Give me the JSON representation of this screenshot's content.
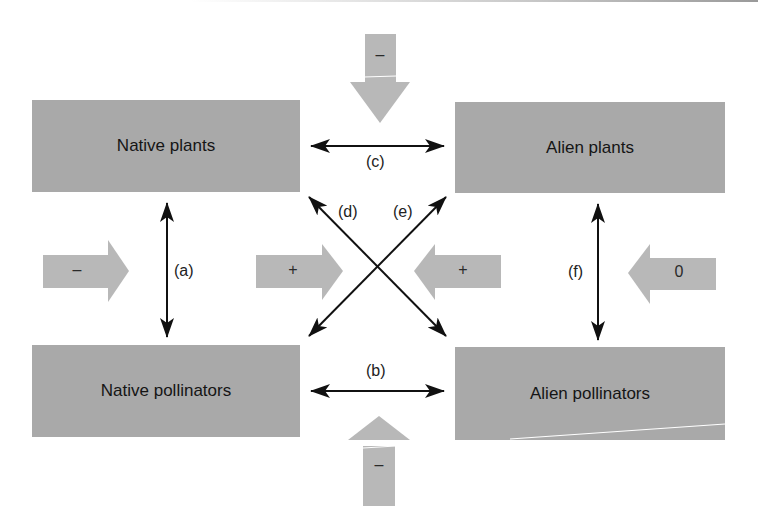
{
  "boxes": {
    "native_plants": "Native plants",
    "alien_plants": "Alien plants",
    "native_pollinators": "Native pollinators",
    "alien_pollinators": "Alien pollinators"
  },
  "interactions": {
    "a": "(a)",
    "b": "(b)",
    "c": "(c)",
    "d": "(d)",
    "e": "(e)",
    "f": "(f)"
  },
  "effects": {
    "top": "–",
    "bottom": "–",
    "left": "–",
    "center_left": "+",
    "center_right": "+",
    "right": "0"
  },
  "colors": {
    "box_fill": "#a9a9a9",
    "effect_arrow_fill": "#b8b8b8",
    "interaction_arrow": "#111111"
  }
}
